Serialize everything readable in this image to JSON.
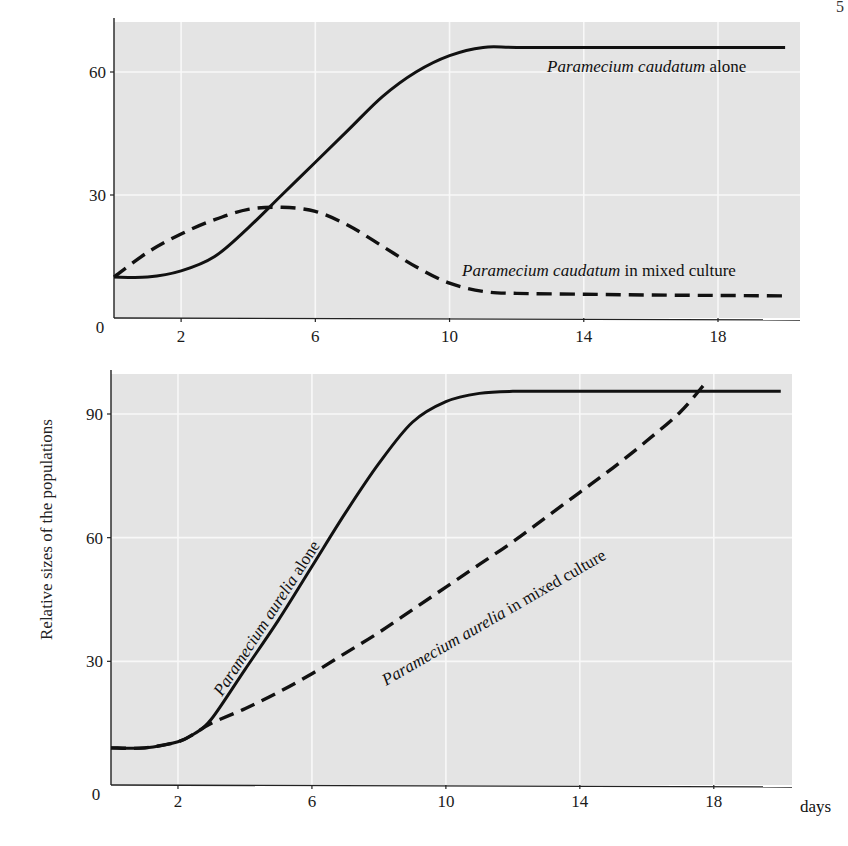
{
  "corner_mark": "5",
  "y_axis_label": "Relative sizes of the populations",
  "x_axis_unit": "days",
  "colors": {
    "plot_bg": "#e4e4e4",
    "grid": "#f8f8f8",
    "line": "#111111"
  },
  "chart_data": [
    {
      "type": "line",
      "panel": "top",
      "title": "",
      "xlabel": "days",
      "ylabel": "Relative sizes of the populations",
      "xlim": [
        0,
        20.5
      ],
      "ylim": [
        0,
        72
      ],
      "x_ticks": [
        2,
        6,
        10,
        14,
        18
      ],
      "x_tick_labels": [
        "2",
        "6",
        "10",
        "14",
        "18"
      ],
      "y_ticks": [
        0,
        30,
        60
      ],
      "y_tick_labels": [
        "0",
        "30",
        "60"
      ],
      "grid": true,
      "series": [
        {
          "name": "Paramecium caudatum alone",
          "style": "solid",
          "x": [
            0,
            1,
            2,
            3,
            4,
            5,
            6,
            7,
            8,
            9,
            10,
            11,
            12,
            14,
            16,
            18,
            20
          ],
          "values": [
            10,
            10,
            11.5,
            15,
            22,
            30,
            38,
            46,
            54,
            60,
            64,
            66,
            66,
            66,
            66,
            66,
            66
          ]
        },
        {
          "name": "Paramecium caudatum in mixed culture",
          "style": "dashed",
          "x": [
            0,
            1,
            2,
            3,
            4,
            5,
            6,
            7,
            8,
            9,
            10,
            11,
            12,
            14,
            16,
            18,
            20
          ],
          "values": [
            10,
            16,
            20.5,
            24,
            26.5,
            27,
            26,
            22.5,
            17.5,
            12.5,
            8.5,
            6.5,
            6,
            5.8,
            5.6,
            5.5,
            5.4
          ]
        }
      ],
      "annotations": [
        {
          "italic": "Paramecium caudatum",
          "roman": " alone"
        },
        {
          "italic": "Paramecium caudatum",
          "roman": " in mixed culture"
        }
      ]
    },
    {
      "type": "line",
      "panel": "bottom",
      "title": "",
      "xlabel": "days",
      "ylabel": "Relative sizes of the populations",
      "xlim": [
        0,
        20.5
      ],
      "ylim": [
        0,
        100
      ],
      "x_ticks": [
        2,
        6,
        10,
        14,
        18
      ],
      "x_tick_labels": [
        "2",
        "6",
        "10",
        "14",
        "18"
      ],
      "y_ticks": [
        0,
        30,
        60,
        90
      ],
      "y_tick_labels": [
        "0",
        "30",
        "60",
        "90"
      ],
      "grid": true,
      "series": [
        {
          "name": "Paramecium aurelia alone",
          "style": "solid",
          "x": [
            0,
            1,
            2,
            2.5,
            3,
            4,
            5,
            6,
            7,
            8,
            9,
            10,
            11,
            12,
            14,
            16,
            18,
            20
          ],
          "values": [
            9,
            9,
            10.5,
            12.5,
            16,
            28,
            40,
            53,
            66,
            78,
            88,
            93,
            95,
            95.5,
            95.5,
            95.5,
            95.5,
            95.5
          ]
        },
        {
          "name": "Paramecium aurelia in mixed culture",
          "style": "dashed",
          "x": [
            0,
            1,
            2,
            2.5,
            3,
            4,
            5,
            6,
            7,
            8,
            9,
            10,
            11,
            12,
            13,
            14,
            15,
            16,
            17,
            17.8
          ],
          "values": [
            9,
            9,
            10.5,
            12.5,
            15,
            18.5,
            22.5,
            27,
            32,
            37,
            42.5,
            48,
            53.5,
            59,
            65,
            71,
            77,
            83.5,
            90.5,
            98
          ]
        }
      ],
      "annotations": [
        {
          "italic": "Paramecium aurelia",
          "roman": " alone"
        },
        {
          "italic": "Paramecium aurelia",
          "roman": " in mixed culture"
        }
      ]
    }
  ]
}
